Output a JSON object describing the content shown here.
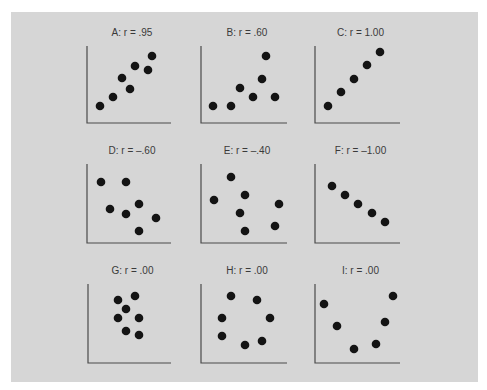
{
  "figure": {
    "background": "#d6d6d6",
    "point_color": "#141414",
    "axis_color": "#4a4a4a"
  },
  "chart_data": [
    {
      "type": "scatter",
      "id": "A",
      "title": "A: r = .95",
      "r": 0.95,
      "grid": false,
      "axis": {
        "x0": 87,
        "y0": 123,
        "x1": 171,
        "ytop": 46
      },
      "points": [
        [
          100,
          106
        ],
        [
          113,
          97
        ],
        [
          122,
          78
        ],
        [
          130,
          89
        ],
        [
          135,
          66
        ],
        [
          148,
          70
        ],
        [
          152,
          56
        ]
      ]
    },
    {
      "type": "scatter",
      "id": "B",
      "title": "B: r = .60",
      "r": 0.6,
      "grid": false,
      "axis": {
        "x0": 201,
        "y0": 123,
        "x1": 287,
        "ytop": 46
      },
      "points": [
        [
          213,
          106
        ],
        [
          231,
          106
        ],
        [
          240,
          88
        ],
        [
          253,
          97
        ],
        [
          262,
          79
        ],
        [
          266,
          56
        ],
        [
          275,
          97
        ]
      ]
    },
    {
      "type": "scatter",
      "id": "C",
      "title": "C: r = 1.00",
      "r": 1.0,
      "grid": false,
      "axis": {
        "x0": 315,
        "y0": 123,
        "x1": 400,
        "ytop": 46
      },
      "points": [
        [
          328,
          106
        ],
        [
          341,
          92
        ],
        [
          354,
          79
        ],
        [
          367,
          65
        ],
        [
          380,
          52
        ]
      ]
    },
    {
      "type": "scatter",
      "id": "D",
      "title": "D: r = –.60",
      "r": -0.6,
      "grid": false,
      "axis": {
        "x0": 87,
        "y0": 243,
        "x1": 171,
        "ytop": 164
      },
      "points": [
        [
          101,
          182
        ],
        [
          126,
          182
        ],
        [
          110,
          209
        ],
        [
          126,
          214
        ],
        [
          139,
          204
        ],
        [
          156,
          218
        ],
        [
          139,
          231
        ]
      ]
    },
    {
      "type": "scatter",
      "id": "E",
      "title": "E: r = –.40",
      "r": -0.4,
      "grid": false,
      "axis": {
        "x0": 201,
        "y0": 243,
        "x1": 287,
        "ytop": 164
      },
      "points": [
        [
          214,
          200
        ],
        [
          231,
          177
        ],
        [
          245,
          195
        ],
        [
          240,
          213
        ],
        [
          245,
          231
        ],
        [
          279,
          204
        ],
        [
          275,
          226
        ]
      ]
    },
    {
      "type": "scatter",
      "id": "F",
      "title": "F: r = –1.00",
      "r": -1.0,
      "grid": false,
      "axis": {
        "x0": 315,
        "y0": 243,
        "x1": 400,
        "ytop": 164
      },
      "points": [
        [
          332,
          186
        ],
        [
          345,
          195
        ],
        [
          358,
          204
        ],
        [
          372,
          213
        ],
        [
          385,
          222
        ]
      ]
    },
    {
      "type": "scatter",
      "id": "G",
      "title": "G: r = .00",
      "r": 0.0,
      "grid": false,
      "axis": {
        "x0": 88,
        "y0": 363,
        "x1": 171,
        "ytop": 284
      },
      "points": [
        [
          118,
          300
        ],
        [
          135,
          296
        ],
        [
          126,
          309
        ],
        [
          118,
          318
        ],
        [
          139,
          318
        ],
        [
          126,
          331
        ],
        [
          139,
          335
        ]
      ]
    },
    {
      "type": "scatter",
      "id": "H",
      "title": "H: r = .00",
      "r": 0.0,
      "grid": false,
      "axis": {
        "x0": 201,
        "y0": 363,
        "x1": 287,
        "ytop": 284
      },
      "points": [
        [
          231,
          296
        ],
        [
          257,
          300
        ],
        [
          222,
          318
        ],
        [
          270,
          318
        ],
        [
          222,
          336
        ],
        [
          245,
          345
        ],
        [
          262,
          341
        ]
      ]
    },
    {
      "type": "scatter",
      "id": "I",
      "title": "I: r = .00",
      "r": 0.0,
      "grid": false,
      "axis": {
        "x0": 315,
        "y0": 363,
        "x1": 400,
        "ytop": 284
      },
      "points": [
        [
          324,
          304
        ],
        [
          337,
          326
        ],
        [
          354,
          349
        ],
        [
          376,
          344
        ],
        [
          385,
          322
        ],
        [
          393,
          296
        ]
      ]
    }
  ]
}
